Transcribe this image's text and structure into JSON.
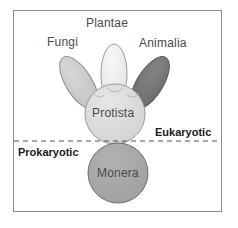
{
  "figure": {
    "type": "five-kingdom-classification-diagram",
    "frame": {
      "border_color": "#8a8a8a",
      "background": "#ffffff"
    }
  },
  "kingdoms": [
    {
      "key": "plantae",
      "label": "Plantae",
      "shape": "ellipse",
      "fill": "#eeeeee",
      "stroke": "#9a9a9a",
      "rotation_deg": 0,
      "cx": 114,
      "cy": 74,
      "rx": 13,
      "ry": 30
    },
    {
      "key": "fungi",
      "label": "Fungi",
      "shape": "ellipse",
      "fill": "#cccccc",
      "stroke": "#8f8f8f",
      "rotation_deg": -32,
      "cx": 79,
      "cy": 83,
      "rx": 13,
      "ry": 30
    },
    {
      "key": "animalia",
      "label": "Animalia",
      "shape": "ellipse",
      "fill": "#767676",
      "stroke": "#5a5a5a",
      "rotation_deg": 32,
      "cx": 150,
      "cy": 83,
      "rx": 13,
      "ry": 30
    },
    {
      "key": "protista",
      "label": "Protista",
      "shape": "circle",
      "fill": "#dcdcdc",
      "stroke": "#9a9a9a",
      "cx": 115,
      "cy": 114,
      "r": 30
    },
    {
      "key": "monera",
      "label": "Monera",
      "shape": "circle",
      "fill": "#a8a8a8",
      "stroke": "#6e6e6e",
      "cx": 118,
      "cy": 173,
      "r": 30
    }
  ],
  "divider": {
    "style": "dashed",
    "color": "#555555",
    "y": 141,
    "x_start": 14,
    "x_end": 221
  },
  "domains": {
    "upper": {
      "label": "Eukaryotic"
    },
    "lower": {
      "label": "Prokaryotic"
    }
  },
  "colors": {
    "text_kingdom": "#4a4a4a",
    "text_domain": "#1a1a1a",
    "frame_border": "#8a8a8a"
  }
}
